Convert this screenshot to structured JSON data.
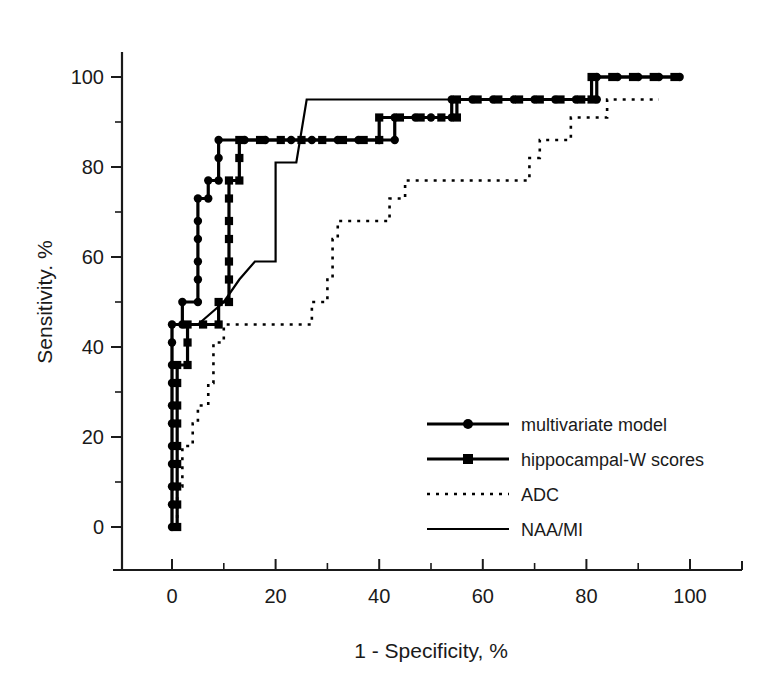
{
  "chart_data": {
    "type": "line",
    "title": "",
    "xlabel": "1 - Specificity, %",
    "ylabel": "Sensitivity. %",
    "xlim": [
      -10,
      110
    ],
    "ylim": [
      -12,
      108
    ],
    "xticks": [
      0,
      20,
      40,
      60,
      80,
      100
    ],
    "xtick_labels": [
      "0",
      "20",
      "40",
      "60",
      "80",
      "100"
    ],
    "xticks_minor": [
      10,
      30,
      50,
      70,
      90
    ],
    "yticks": [
      0,
      20,
      40,
      60,
      80,
      100
    ],
    "ytick_labels": [
      "0",
      "20",
      "40",
      "60",
      "80",
      "100"
    ],
    "yticks_minor": [
      10,
      30,
      50,
      70,
      90
    ],
    "grid": false,
    "legend_position": "lower right",
    "series": [
      {
        "name": "multivariate model",
        "marker": "circle",
        "linestyle": "solid",
        "linewidth": "thick",
        "points": [
          [
            0,
            0
          ],
          [
            0,
            5
          ],
          [
            0,
            9
          ],
          [
            0,
            14
          ],
          [
            0,
            18
          ],
          [
            0,
            23
          ],
          [
            0,
            27
          ],
          [
            0,
            32
          ],
          [
            0,
            36
          ],
          [
            0,
            41
          ],
          [
            0,
            45
          ],
          [
            2,
            45
          ],
          [
            2,
            50
          ],
          [
            5,
            50
          ],
          [
            5,
            55
          ],
          [
            5,
            59
          ],
          [
            5,
            64
          ],
          [
            5,
            68
          ],
          [
            5,
            73
          ],
          [
            7,
            73
          ],
          [
            7,
            77
          ],
          [
            9,
            77
          ],
          [
            9,
            82
          ],
          [
            9,
            86
          ],
          [
            14,
            86
          ],
          [
            18,
            86
          ],
          [
            23,
            86
          ],
          [
            27,
            86
          ],
          [
            32,
            86
          ],
          [
            36,
            86
          ],
          [
            40,
            86
          ],
          [
            43,
            86
          ],
          [
            43,
            91
          ],
          [
            47,
            91
          ],
          [
            50,
            91
          ],
          [
            54,
            91
          ],
          [
            54,
            95
          ],
          [
            58,
            95
          ],
          [
            62,
            95
          ],
          [
            66,
            95
          ],
          [
            70,
            95
          ],
          [
            74,
            95
          ],
          [
            78,
            95
          ],
          [
            82,
            95
          ],
          [
            82,
            100
          ],
          [
            86,
            100
          ],
          [
            90,
            100
          ],
          [
            94,
            100
          ],
          [
            98,
            100
          ]
        ]
      },
      {
        "name": "hippocampal-W scores",
        "marker": "square",
        "linestyle": "solid",
        "linewidth": "thick",
        "points": [
          [
            1,
            0
          ],
          [
            1,
            5
          ],
          [
            1,
            9
          ],
          [
            1,
            14
          ],
          [
            1,
            18
          ],
          [
            1,
            23
          ],
          [
            1,
            27
          ],
          [
            1,
            32
          ],
          [
            1,
            36
          ],
          [
            3,
            36
          ],
          [
            3,
            41
          ],
          [
            3,
            45
          ],
          [
            6,
            45
          ],
          [
            9,
            45
          ],
          [
            9,
            50
          ],
          [
            11,
            50
          ],
          [
            11,
            55
          ],
          [
            11,
            59
          ],
          [
            11,
            64
          ],
          [
            11,
            68
          ],
          [
            11,
            73
          ],
          [
            11,
            77
          ],
          [
            13,
            77
          ],
          [
            13,
            82
          ],
          [
            13,
            86
          ],
          [
            17,
            86
          ],
          [
            21,
            86
          ],
          [
            25,
            86
          ],
          [
            29,
            86
          ],
          [
            33,
            86
          ],
          [
            37,
            86
          ],
          [
            40,
            86
          ],
          [
            40,
            91
          ],
          [
            44,
            91
          ],
          [
            48,
            91
          ],
          [
            52,
            91
          ],
          [
            55,
            91
          ],
          [
            55,
            95
          ],
          [
            59,
            95
          ],
          [
            63,
            95
          ],
          [
            67,
            95
          ],
          [
            71,
            95
          ],
          [
            75,
            95
          ],
          [
            79,
            95
          ],
          [
            81,
            95
          ],
          [
            81,
            100
          ],
          [
            85,
            100
          ],
          [
            89,
            100
          ],
          [
            93,
            100
          ],
          [
            97,
            100
          ]
        ]
      },
      {
        "name": "ADC",
        "marker": "none",
        "linestyle": "dotted",
        "linewidth": "dotted",
        "points": [
          [
            1,
            0
          ],
          [
            1,
            9
          ],
          [
            2,
            9
          ],
          [
            2,
            18
          ],
          [
            4,
            18
          ],
          [
            4,
            23
          ],
          [
            5,
            23
          ],
          [
            5,
            27
          ],
          [
            7,
            27
          ],
          [
            7,
            32
          ],
          [
            8,
            32
          ],
          [
            8,
            41
          ],
          [
            10,
            41
          ],
          [
            10,
            45
          ],
          [
            15,
            45
          ],
          [
            25,
            45
          ],
          [
            27,
            45
          ],
          [
            27,
            50
          ],
          [
            30,
            50
          ],
          [
            30,
            55
          ],
          [
            31,
            55
          ],
          [
            31,
            64
          ],
          [
            32,
            64
          ],
          [
            32,
            68
          ],
          [
            38,
            68
          ],
          [
            42,
            68
          ],
          [
            42,
            73
          ],
          [
            45,
            73
          ],
          [
            45,
            77
          ],
          [
            52,
            77
          ],
          [
            60,
            77
          ],
          [
            68,
            77
          ],
          [
            69,
            77
          ],
          [
            69,
            82
          ],
          [
            71,
            82
          ],
          [
            71,
            86
          ],
          [
            76,
            86
          ],
          [
            77,
            86
          ],
          [
            77,
            91
          ],
          [
            82,
            91
          ],
          [
            84,
            91
          ],
          [
            84,
            95
          ],
          [
            88,
            95
          ],
          [
            94,
            95
          ]
        ]
      },
      {
        "name": "NAA/MI",
        "marker": "none",
        "linestyle": "solid",
        "linewidth": "thin",
        "points": [
          [
            0,
            0
          ],
          [
            0,
            45
          ],
          [
            5,
            45
          ],
          [
            10,
            50
          ],
          [
            13,
            55
          ],
          [
            16,
            59
          ],
          [
            20,
            59
          ],
          [
            20,
            81
          ],
          [
            24,
            81
          ],
          [
            26,
            95
          ],
          [
            35,
            95
          ],
          [
            45,
            95
          ],
          [
            55,
            95
          ],
          [
            62,
            95
          ]
        ]
      }
    ]
  },
  "legend": {
    "entries": [
      {
        "label": "multivariate model",
        "marker": "circle",
        "style": "solid-thick"
      },
      {
        "label": "hippocampal-W scores",
        "marker": "square",
        "style": "solid-thick"
      },
      {
        "label": "ADC",
        "marker": "none",
        "style": "dotted"
      },
      {
        "label": "NAA/MI",
        "marker": "none",
        "style": "solid-thin"
      }
    ]
  },
  "colors": {
    "foreground": "#1a1a1a",
    "series": "#000000",
    "background": "#ffffff"
  }
}
